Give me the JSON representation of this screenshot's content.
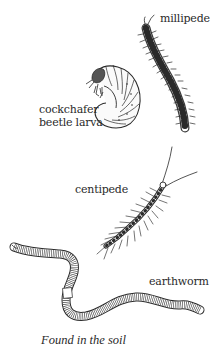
{
  "figure": {
    "caption": "Found in the soil",
    "ink_color": "#2a2a2a",
    "background": "#ffffff",
    "creatures": [
      {
        "id": "millipede",
        "label": "millipede"
      },
      {
        "id": "cockchafer",
        "label_line1": "cockchafer",
        "label_line2": "beetle larva"
      },
      {
        "id": "centipede",
        "label": "centipede"
      },
      {
        "id": "earthworm",
        "label": "earthworm"
      }
    ]
  }
}
